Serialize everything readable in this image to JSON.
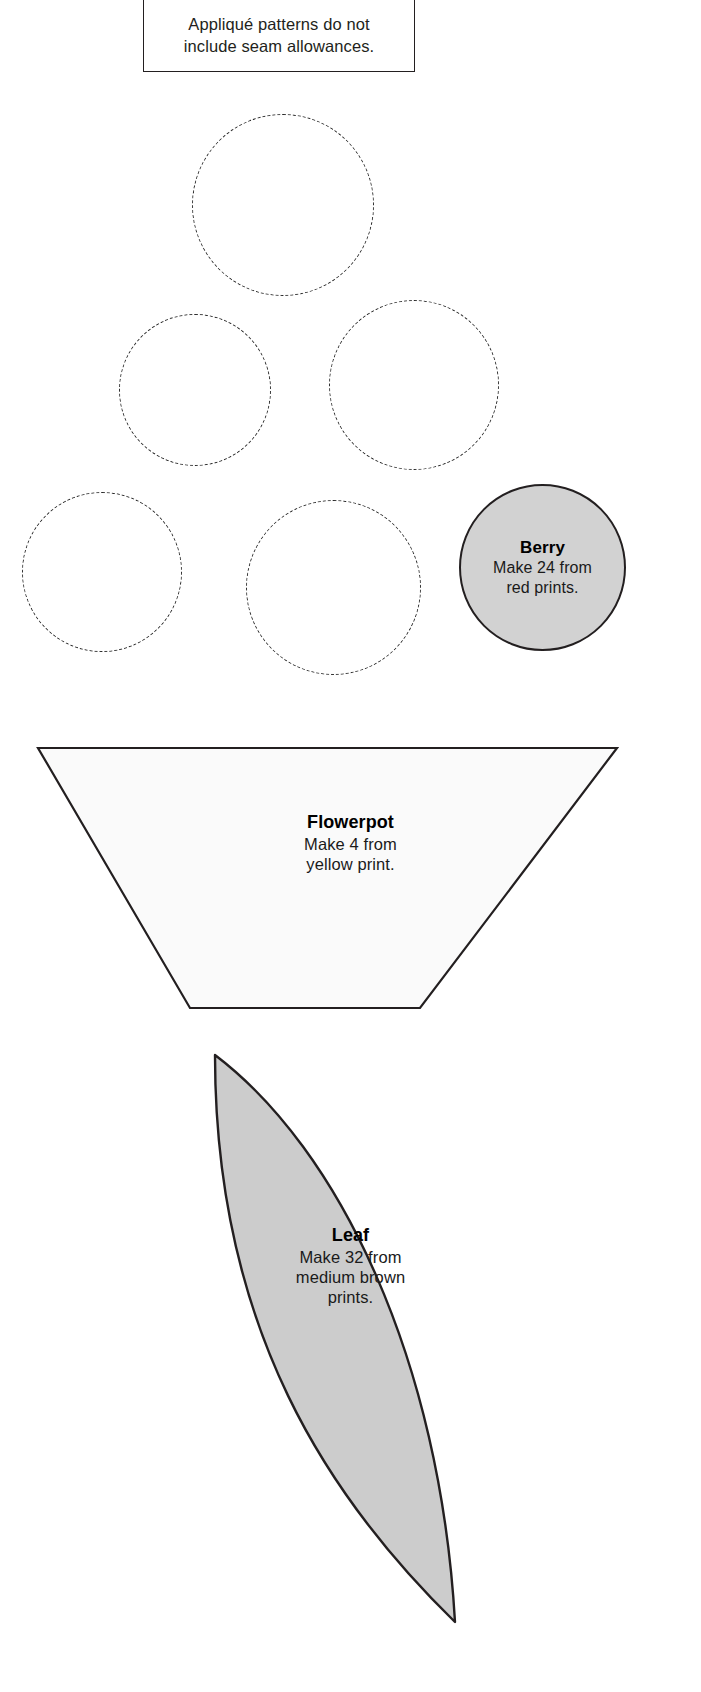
{
  "page": {
    "background_color": "#ffffff",
    "outline_color": "#231f20",
    "width": 701,
    "height": 1692
  },
  "note": {
    "line1": "Appliqué patterns do not",
    "line2": "include seam allowances."
  },
  "pieces": {
    "flower_circles": {
      "name": "flower-circle",
      "style": "dashed",
      "stroke_color": "#2b2b2b",
      "count": 5,
      "circles": [
        {
          "left": 192,
          "top": 114,
          "size": 182
        },
        {
          "left": 119,
          "top": 314,
          "size": 152
        },
        {
          "left": 329,
          "top": 300,
          "size": 170
        },
        {
          "left": 22,
          "top": 492,
          "size": 160
        },
        {
          "left": 246,
          "top": 500,
          "size": 175
        }
      ]
    },
    "berry": {
      "title": "Berry",
      "sub_line1": "Make 24 from",
      "sub_line2": "red prints.",
      "fill_color": "#d2d2d2",
      "stroke_color": "#231f20"
    },
    "flowerpot": {
      "title": "Flowerpot",
      "sub_line1": "Make 4 from",
      "sub_line2": "yellow print.",
      "fill_color": "#fafafa",
      "stroke_color": "#231f20"
    },
    "leaf": {
      "title": "Leaf",
      "sub_line1": "Make 32 from",
      "sub_line2": "medium brown",
      "sub_line3": "prints.",
      "fill_color": "#cccccc",
      "stroke_color": "#231f20"
    }
  }
}
